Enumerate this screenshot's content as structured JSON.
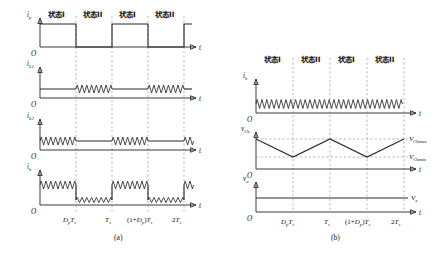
{
  "figure": {
    "caption_a": "(a)",
    "caption_b": "(b)",
    "state_labels": {
      "state1": "状态I",
      "state2": "状态II"
    },
    "time_ticks": {
      "t1_main": "D",
      "t1_sub": "p",
      "t1_sub2": "T",
      "t1_sub3": "s",
      "t1": "DpTs",
      "t2": "Ts",
      "t3": "(1+Dp)Ts",
      "t4": "2Ts"
    },
    "origin": "O",
    "time_axis": "t"
  },
  "panel_a": {
    "id": "a",
    "caption": "(a)",
    "state_sequence": [
      "状态I",
      "状态II",
      "状态I",
      "状态II"
    ],
    "tick_labels": [
      "DpTs",
      "Ts",
      "(1+Dp)Ts",
      "2Ts"
    ],
    "plots": [
      {
        "name": "ip",
        "ylabel_main": "i",
        "ylabel_sub": "p",
        "type": "square",
        "description": "square wave high during State I, low during State II"
      },
      {
        "name": "iL1",
        "ylabel_main": "i",
        "ylabel_sub": "L1",
        "type": "flat-with-ripple",
        "description": "constant level, high-frequency ripple during State II intervals"
      },
      {
        "name": "iL2",
        "ylabel_main": "i",
        "ylabel_sub": "L2",
        "type": "flat-with-ripple",
        "description": "constant level, high-frequency ripple during State I intervals"
      },
      {
        "name": "ib",
        "ylabel_main": "i",
        "ylabel_sub": "b",
        "type": "square-with-ripple",
        "description": "two-level square wave, ripple on both high and low segments"
      }
    ]
  },
  "panel_b": {
    "id": "b",
    "caption": "(b)",
    "state_sequence": [
      "状态I",
      "状态II",
      "状态I",
      "状态II"
    ],
    "tick_labels": [
      "DpTs",
      "Ts",
      "(1+Dp)Ts",
      "2Ts"
    ],
    "plots": [
      {
        "name": "ib",
        "ylabel_main": "i",
        "ylabel_sub": "b",
        "type": "continuous-ripple",
        "description": "single level with continuous high-frequency ripple"
      },
      {
        "name": "vCb",
        "ylabel_main": "v",
        "ylabel_sub": "Cb",
        "type": "triangular",
        "level_max_main": "V",
        "level_max_sub": "Cbmax",
        "level_min_main": "V",
        "level_min_sub": "Cbmin",
        "description": "triangular ripple between VCbmax and VCbmin"
      },
      {
        "name": "va",
        "ylabel_main": "v",
        "ylabel_sub": "a",
        "type": "constant",
        "level_main": "V",
        "level_sub": "a",
        "description": "constant DC level Va"
      }
    ]
  },
  "colors": {
    "line": "#2b2b2b",
    "axis": "#3a3a3a",
    "grid": "#9a9a9a",
    "background": "#ffffff"
  }
}
